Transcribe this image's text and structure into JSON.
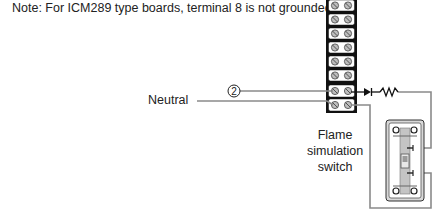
{
  "note": "Note: For ICM289 type boards, terminal 8 is not grounded.",
  "labels": {
    "neutral": "Neutral",
    "flame_switch_line1": "Flame",
    "flame_switch_line2": "simulation",
    "flame_switch_line3": "switch",
    "terminal_callout": "2"
  },
  "terminal_strip": {
    "rows": 8,
    "screws_per_row": 2
  },
  "components": [
    "terminal-strip",
    "diode",
    "resistor",
    "toggle-switch"
  ],
  "colors": {
    "wire": "#8a8a8a",
    "outline": "#111111",
    "screw": "#b8b8b8",
    "switch_body": "#c8c8c8"
  }
}
